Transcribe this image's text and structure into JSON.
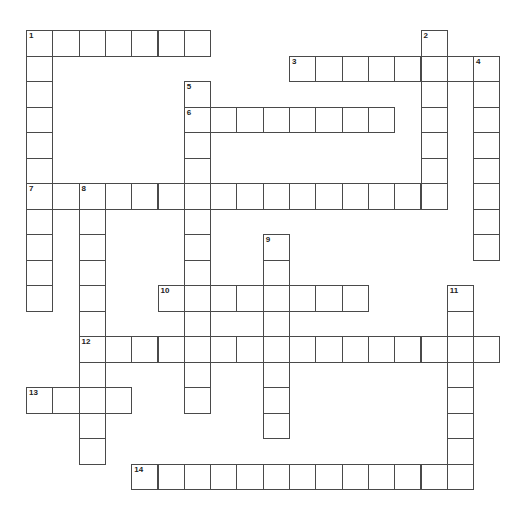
{
  "puzzle": {
    "origin": {
      "x": 26,
      "y": 30
    },
    "cell_w": 26.3,
    "cell_h": 25.5,
    "border_color": "#4a4a4a",
    "words": [
      {
        "number": "1",
        "dir": "across",
        "row": 0,
        "col": 0,
        "length": 7
      },
      {
        "number": "1",
        "dir": "down",
        "row": 0,
        "col": 0,
        "length": 11
      },
      {
        "number": "2",
        "dir": "down",
        "row": 0,
        "col": 15,
        "length": 7
      },
      {
        "number": "3",
        "dir": "across",
        "row": 1,
        "col": 10,
        "length": 8
      },
      {
        "number": "4",
        "dir": "down",
        "row": 1,
        "col": 17,
        "length": 8
      },
      {
        "number": "5",
        "dir": "down",
        "row": 2,
        "col": 6,
        "length": 13
      },
      {
        "number": "6",
        "dir": "across",
        "row": 3,
        "col": 6,
        "length": 8
      },
      {
        "number": "7",
        "dir": "across",
        "row": 6,
        "col": 0,
        "length": 16
      },
      {
        "number": "8",
        "dir": "down",
        "row": 6,
        "col": 2,
        "length": 11
      },
      {
        "number": "9",
        "dir": "down",
        "row": 8,
        "col": 9,
        "length": 8
      },
      {
        "number": "10",
        "dir": "across",
        "row": 10,
        "col": 5,
        "length": 8
      },
      {
        "number": "11",
        "dir": "down",
        "row": 10,
        "col": 16,
        "length": 8
      },
      {
        "number": "12",
        "dir": "across",
        "row": 12,
        "col": 2,
        "length": 16
      },
      {
        "number": "13",
        "dir": "across",
        "row": 14,
        "col": 0,
        "length": 4
      },
      {
        "number": "14",
        "dir": "across",
        "row": 17,
        "col": 4,
        "length": 13
      }
    ]
  }
}
